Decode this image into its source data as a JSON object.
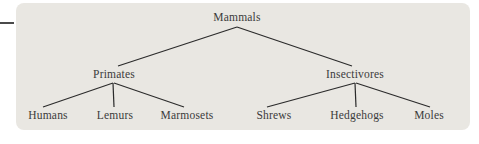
{
  "diagram_title": "Mammals classification tree",
  "tree": {
    "root": {
      "label": "Mammals",
      "children": [
        {
          "label": "Primates",
          "children": [
            {
              "label": "Humans"
            },
            {
              "label": "Lemurs"
            },
            {
              "label": "Marmosets"
            }
          ]
        },
        {
          "label": "Insectivores",
          "children": [
            {
              "label": "Shrews"
            },
            {
              "label": "Hedgehogs"
            },
            {
              "label": "Moles"
            }
          ]
        }
      ]
    }
  },
  "colors": {
    "panel_bg": "#e9e7e2",
    "line": "#2b2b2b",
    "text": "#3b3b3b",
    "page_bg": "#ffffff"
  }
}
